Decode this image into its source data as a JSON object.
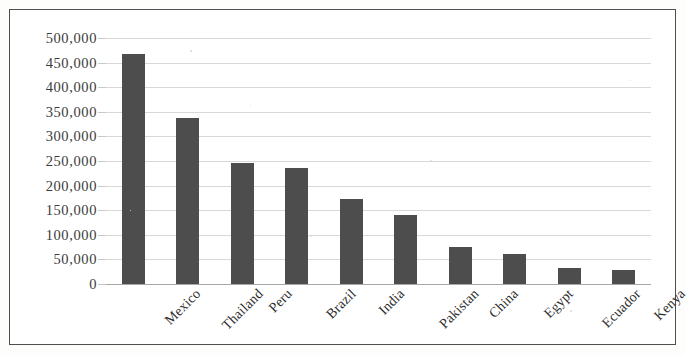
{
  "chart_data": {
    "type": "bar",
    "title": "",
    "subtitle": "",
    "xlabel": "",
    "ylabel": "",
    "categories": [
      "Mexico",
      "Thailand",
      "Peru",
      "Brazil",
      "India",
      "Pakistan",
      "China",
      "Egypt",
      "Ecuador",
      "Kenya"
    ],
    "values": [
      468000,
      338000,
      245000,
      235000,
      172000,
      140000,
      76000,
      61000,
      33000,
      29000
    ],
    "series": [
      {
        "name": "",
        "values": [
          468000,
          338000,
          245000,
          235000,
          172000,
          140000,
          76000,
          61000,
          33000,
          29000
        ]
      }
    ],
    "ylim": [
      0,
      500000
    ],
    "ytick_values": [
      0,
      50000,
      100000,
      150000,
      200000,
      250000,
      300000,
      350000,
      400000,
      450000,
      500000
    ],
    "ytick_labels": [
      "0",
      "50,000",
      "100,000",
      "150,000",
      "200,000",
      "250,000",
      "300,000",
      "350,000",
      "400,000",
      "450,000",
      "500,000"
    ],
    "grid": true,
    "grid_axis": "y",
    "legend": false,
    "legend_position": "none",
    "bar_color": "#4d4d4d",
    "gridline_color": "#d8d8d8",
    "axis_color": "#a8a8a8",
    "border_color": "#4e4e4e",
    "background_color": "#ffffff",
    "annotations": []
  }
}
